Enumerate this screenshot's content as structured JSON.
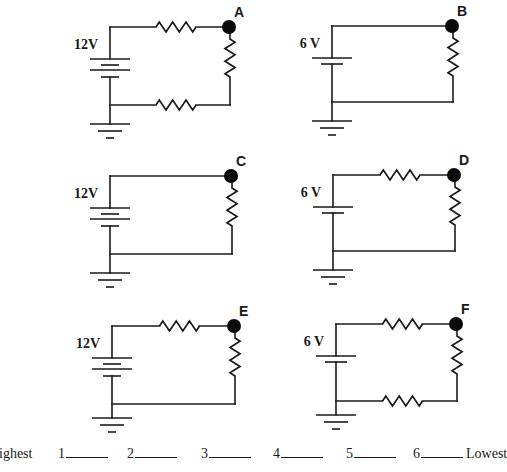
{
  "circuits": [
    {
      "node_label": "A",
      "voltage_label": "12V",
      "cells": 2,
      "resistors": [
        "top",
        "right",
        "bottom"
      ]
    },
    {
      "node_label": "B",
      "voltage_label": "6 V",
      "cells": 1,
      "resistors": [
        "right"
      ]
    },
    {
      "node_label": "C",
      "voltage_label": "12V",
      "cells": 2,
      "resistors": [
        "right"
      ]
    },
    {
      "node_label": "D",
      "voltage_label": "6 V",
      "cells": 1,
      "resistors": [
        "top",
        "right"
      ]
    },
    {
      "node_label": "E",
      "voltage_label": "12V",
      "cells": 2,
      "resistors": [
        "top",
        "right"
      ]
    },
    {
      "node_label": "F",
      "voltage_label": "6 V",
      "cells": 1,
      "resistors": [
        "top",
        "right",
        "bottom"
      ]
    }
  ],
  "ranking": {
    "highest_label": "ighest",
    "lowest_label": "Lowest",
    "slots": [
      "1",
      "2",
      "3",
      "4",
      "5",
      "6"
    ],
    "answers": [
      "",
      "",
      "",
      "",
      "",
      ""
    ]
  }
}
